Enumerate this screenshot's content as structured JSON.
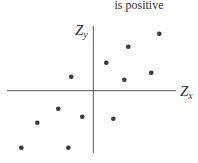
{
  "caption": {
    "text": "is positive"
  },
  "axes": {
    "x_label": "Z",
    "x_sub": "x",
    "y_label": "Z",
    "y_sub": "y",
    "color": "#555555"
  },
  "point_color": "#3a3a3a",
  "chart_data": {
    "type": "scatter",
    "title": "is positive",
    "xlabel": "Z_x",
    "ylabel": "Z_y",
    "grid": false,
    "note": "Standardized scores showing positive correlation; axes cross at origin (0,0). Coordinates are in pixel space relative to origin (right = +x, up = +y).",
    "points": [
      {
        "x": -22,
        "y": 14
      },
      {
        "x": 13,
        "y": 28
      },
      {
        "x": 35,
        "y": 44
      },
      {
        "x": 66,
        "y": 57
      },
      {
        "x": 31,
        "y": 11
      },
      {
        "x": 58,
        "y": 18
      },
      {
        "x": -35,
        "y": -18
      },
      {
        "x": -11,
        "y": -26
      },
      {
        "x": -56,
        "y": -32
      },
      {
        "x": 20,
        "y": -28
      },
      {
        "x": -72,
        "y": -57
      },
      {
        "x": -25,
        "y": -57
      }
    ]
  }
}
